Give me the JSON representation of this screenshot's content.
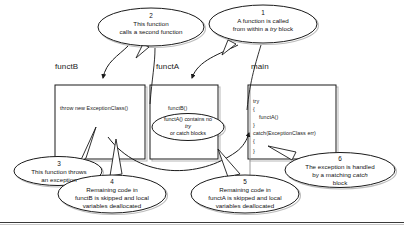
{
  "diagram": {
    "stroke_color": "#1a1a1a",
    "shadow_color": "#b0b0b0",
    "background": "#ffffff"
  },
  "frames": [
    {
      "id": "functB",
      "label": "functB",
      "code": [
        "throw new ExceptionClass()"
      ]
    },
    {
      "id": "functA",
      "label": "functA",
      "code": [
        "functB()"
      ]
    },
    {
      "id": "main",
      "label": "main",
      "code": [
        "try",
        "{",
        "functA()",
        "}",
        "catch(ExceptionClass err)",
        "{",
        "}"
      ]
    }
  ],
  "inner_note": {
    "line1": "functA() contains no",
    "line2": "try",
    "line3": "or catch blocks"
  },
  "callouts": [
    {
      "number": "1",
      "lines": [
        "A function is called",
        "from within a try block"
      ],
      "italic_word": "try"
    },
    {
      "number": "2",
      "lines": [
        "This function",
        "calls a second function"
      ],
      "italic_word": ""
    },
    {
      "number": "3",
      "lines": [
        "This function throws",
        "an exception"
      ],
      "italic_word": ""
    },
    {
      "number": "4",
      "lines": [
        "Remaining code in",
        "functB is skipped and local",
        "variables deallocated"
      ],
      "italic_word": ""
    },
    {
      "number": "5",
      "lines": [
        "Remaining code in",
        "functA is skipped and local",
        "variables deallocated"
      ],
      "italic_word": ""
    },
    {
      "number": "6",
      "lines": [
        "The exception is handled",
        "by a matching catch",
        "block"
      ],
      "italic_word": "catch"
    }
  ]
}
